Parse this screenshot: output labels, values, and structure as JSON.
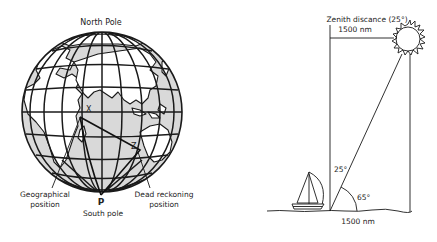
{
  "globe": {
    "north_label": "North Pole",
    "south_label": "South pole",
    "pole_marker": "P",
    "point_x": "X",
    "point_z": "Z",
    "geo_label_line1": "Geographical",
    "geo_label_line2": "position",
    "dr_label_line1": "Dead reckoning",
    "dr_label_line2": "position",
    "colors": {
      "ocean": "#d9d9d9",
      "land": "#ffffff",
      "lines": "#1a1a1a"
    }
  },
  "sight": {
    "zenith_label": "Zenith discance (25°)",
    "top_distance": "1500 nm",
    "bottom_distance": "1500 nm",
    "zenith_angle": "25°",
    "altitude_angle": "65°",
    "icons": [
      "sun-icon",
      "sailboat-icon"
    ]
  }
}
